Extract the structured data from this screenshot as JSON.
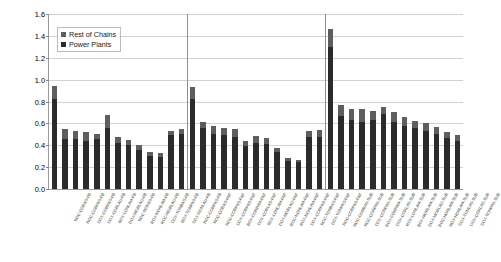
{
  "chart_data": {
    "type": "bar",
    "subtype": "stacked-bar",
    "title": "",
    "xlabel": "",
    "ylabel": "[Million YOLL / year (2020)]",
    "ylim": [
      0.0,
      1.6
    ],
    "ytick_step": 0.2,
    "yticks": [
      "0.0",
      "0.2",
      "0.4",
      "0.6",
      "0.8",
      "1.0",
      "1.2",
      "1.4",
      "1.6"
    ],
    "grid": true,
    "legend_position": "upper-left-inside",
    "group_separators": 2,
    "legend": [
      "Rest of Chains",
      "Power Plants"
    ],
    "colors": {
      "rest_of_chains": "#5e5e5e",
      "power_plants": "#2b2b2b",
      "axis": "#9a9a9a",
      "grid": "#d2d2d2"
    },
    "categories": [
      "ROC-CORAS-FB",
      "ROC-CORPAS-FB",
      "DOX-CORPAS-FB",
      "DOX-CORLAU-FB",
      "ROX-LONLAM-FB",
      "DOX-MORLAU-FB",
      "ROC-NONAS-FB",
      "ROX-NONLAM-FB",
      "ROC-MORLAU-FB",
      "DOX-TONBAS-FB",
      "ROX-TONPAS-FB",
      "DOX-DONLAU-FB",
      "ROC-CORPAS-FB",
      "ROC-CORAS-FAF",
      "ROC-CORPAS-FAF",
      "DOX-CORPAS-FAF",
      "BOX-CORPAM-FAF",
      "DOX-CORLAS-FAF",
      "ROX-LONLAM-FAF",
      "DOX-MORLAU-FAF",
      "ROC-NONLAM-FAF",
      "ROX-NONLAM-FAF",
      "DOX-CORPAS-FAF",
      "ROC-TONBAS-FAF",
      "DOX-TONPAS-FAF",
      "ROC-CORPAS-FAF",
      "ROC-CORBAS-SUB",
      "ROC-CORPAS-SUB",
      "DOX-CORPAS-SUB",
      "ROX-CORPAM-SUB",
      "DOX-CORLAS-SUB",
      "ROX-LONLAM-SUB",
      "BOX-MORLAM-SUB",
      "DOX-MORLAU-SUB",
      "ROC-NONLAM-SUB",
      "ROX-NONLAM-SUB",
      "DOX-TONLAS-SUB",
      "DOX-CORLAS-SUB",
      "DOX-TONPAS-SUB"
    ],
    "series": [
      {
        "name": "Power Plants",
        "values": [
          0.82,
          0.46,
          0.455,
          0.44,
          0.455,
          0.555,
          0.42,
          0.4,
          0.355,
          0.305,
          0.295,
          0.49,
          0.505,
          0.82,
          0.555,
          0.505,
          0.495,
          0.475,
          0.395,
          0.425,
          0.41,
          0.34,
          0.26,
          0.245,
          0.475,
          0.48,
          1.3,
          0.665,
          0.63,
          0.615,
          0.63,
          0.685,
          0.615,
          0.58,
          0.555,
          0.53,
          0.5,
          0.465,
          0.44
        ]
      },
      {
        "name": "Rest of Chains",
        "values": [
          0.12,
          0.09,
          0.075,
          0.08,
          0.045,
          0.12,
          0.055,
          0.05,
          0.045,
          0.03,
          0.035,
          0.04,
          0.045,
          0.11,
          0.055,
          0.075,
          0.065,
          0.07,
          0.045,
          0.06,
          0.06,
          0.035,
          0.02,
          0.02,
          0.055,
          0.06,
          0.16,
          0.105,
          0.1,
          0.115,
          0.085,
          0.065,
          0.085,
          0.08,
          0.07,
          0.07,
          0.065,
          0.06,
          0.055
        ]
      }
    ],
    "totals": [
      0.94,
      0.55,
      0.53,
      0.52,
      0.5,
      0.675,
      0.475,
      0.45,
      0.4,
      0.335,
      0.33,
      0.53,
      0.55,
      0.93,
      0.61,
      0.58,
      0.56,
      0.545,
      0.44,
      0.485,
      0.47,
      0.375,
      0.28,
      0.265,
      0.53,
      0.54,
      1.46,
      0.77,
      0.73,
      0.73,
      0.715,
      0.75,
      0.7,
      0.66,
      0.625,
      0.6,
      0.565,
      0.525,
      0.495
    ]
  }
}
